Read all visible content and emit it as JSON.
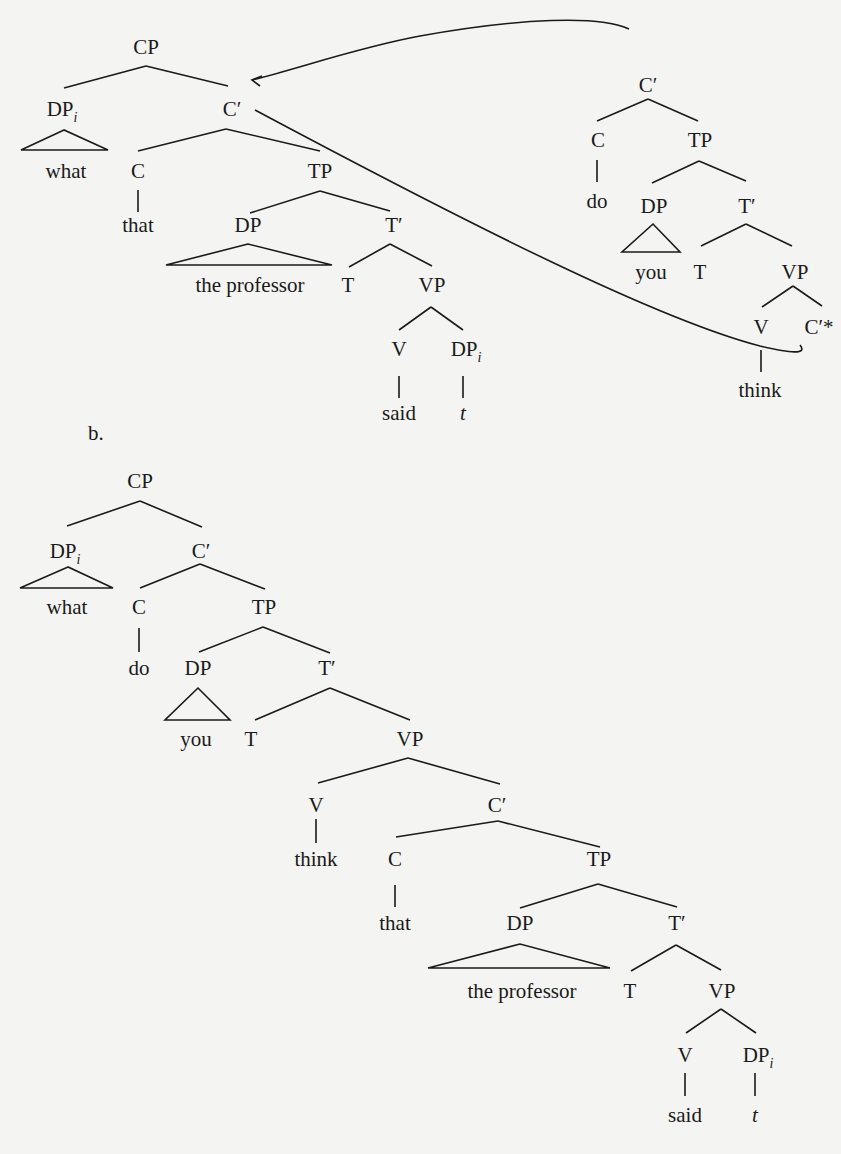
{
  "figure": {
    "part_b_label": "b.",
    "arrow_note": "C′ subtree substituted into C′* slot"
  },
  "tree_a_left": {
    "cp": "CP",
    "dp_wh": "DP",
    "dp_wh_sub": "i",
    "what": "what",
    "cbar": "C′",
    "c": "C",
    "that": "that",
    "tp": "TP",
    "dp_subj": "DP",
    "the_professor": "the professor",
    "tbar": "T′",
    "t": "T",
    "vp": "VP",
    "v": "V",
    "dp_obj": "DP",
    "dp_obj_sub": "i",
    "said": "said",
    "trace": "t"
  },
  "tree_a_right": {
    "cbar": "C′",
    "c": "C",
    "do": "do",
    "tp": "TP",
    "dp": "DP",
    "you": "you",
    "tbar": "T′",
    "t": "T",
    "vp": "VP",
    "v": "V",
    "cbar_star": "C′*",
    "think": "think"
  },
  "tree_b": {
    "cp": "CP",
    "dp_wh": "DP",
    "dp_wh_sub": "i",
    "what": "what",
    "cbar": "C′",
    "c": "C",
    "do": "do",
    "tp": "TP",
    "dp": "DP",
    "you": "you",
    "tbar": "T′",
    "t": "T",
    "vp": "VP",
    "v": "V",
    "think": "think",
    "cbar2": "C′",
    "c2": "C",
    "that": "that",
    "tp2": "TP",
    "dp2": "DP",
    "the_professor": "the professor",
    "tbar2": "T′",
    "t2": "T",
    "vp2": "VP",
    "v2": "V",
    "dp_obj": "DP",
    "dp_obj_sub": "i",
    "said": "said",
    "trace": "t"
  }
}
